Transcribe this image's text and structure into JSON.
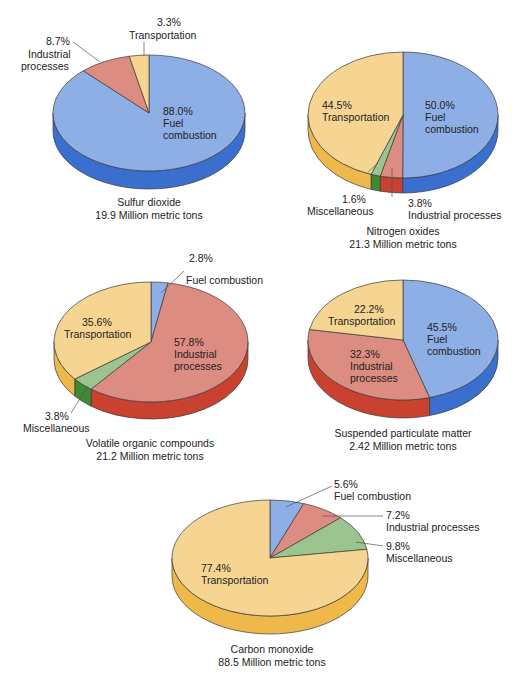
{
  "colors": {
    "fuel_combustion": {
      "top": "#8eaee6",
      "side": "#3b6fcf"
    },
    "industrial_processes": {
      "top": "#dc8c80",
      "side": "#c8422f"
    },
    "transportation": {
      "top": "#f6d592",
      "side": "#eeb94a"
    },
    "miscellaneous": {
      "top": "#9cc48e",
      "side": "#3f8a35"
    },
    "outline": "#3a3a3a"
  },
  "chart_data": [
    {
      "type": "pie",
      "title": "Sulfur dioxide",
      "subtitle": "19.9 Million metric tons",
      "categories": [
        "Fuel combustion",
        "Industrial processes",
        "Transportation"
      ],
      "values": [
        88.0,
        8.7,
        3.3
      ],
      "labels": [
        "88.0%",
        "8.7%",
        "3.3%"
      ]
    },
    {
      "type": "pie",
      "title": "Nitrogen oxides",
      "subtitle": "21.3 Million metric tons",
      "categories": [
        "Fuel combustion",
        "Industrial processes",
        "Miscellaneous",
        "Transportation"
      ],
      "values": [
        50.0,
        3.8,
        1.6,
        44.5
      ],
      "labels": [
        "50.0%",
        "3.8%",
        "1.6%",
        "44.5%"
      ]
    },
    {
      "type": "pie",
      "title": "Volatile organic compounds",
      "subtitle": "21.2 Million metric tons",
      "categories": [
        "Fuel combustion",
        "Industrial processes",
        "Miscellaneous",
        "Transportation"
      ],
      "values": [
        2.8,
        57.8,
        3.8,
        35.6
      ],
      "labels": [
        "2.8%",
        "57.8%",
        "3.8%",
        "35.6%"
      ]
    },
    {
      "type": "pie",
      "title": "Suspended particulate matter",
      "subtitle": "2.42 Million metric tons",
      "categories": [
        "Fuel combustion",
        "Industrial processes",
        "Transportation"
      ],
      "values": [
        45.5,
        32.3,
        22.2
      ],
      "labels": [
        "45.5%",
        "32.3%",
        "22.2%"
      ]
    },
    {
      "type": "pie",
      "title": "Carbon monoxide",
      "subtitle": "88.5 Million metric tons",
      "categories": [
        "Fuel combustion",
        "Industrial processes",
        "Miscellaneous",
        "Transportation"
      ],
      "values": [
        5.6,
        7.2,
        9.8,
        77.4
      ],
      "labels": [
        "5.6%",
        "7.2%",
        "9.8%",
        "77.4%"
      ]
    }
  ],
  "text": {
    "so2": {
      "fuel_pct": "88.0%",
      "fuel_l1": "Fuel",
      "fuel_l2": "combustion",
      "ind_pct": "8.7%",
      "ind_l1": "Industrial",
      "ind_l2": "processes",
      "trans_pct": "3.3%",
      "trans_l1": "Transportation",
      "cap1": "Sulfur dioxide",
      "cap2": "19.9 Million metric tons"
    },
    "nox": {
      "trans_pct": "44.5%",
      "trans_l1": "Transportation",
      "fuel_pct": "50.0%",
      "fuel_l1": "Fuel",
      "fuel_l2": "combustion",
      "misc_pct": "1.6%",
      "misc_l1": "Miscellaneous",
      "ind_pct": "3.8%",
      "ind_l1": "Industrial processes",
      "cap1": "Nitrogen oxides",
      "cap2": "21.3 Million metric tons"
    },
    "voc": {
      "fuel_pct": "2.8%",
      "fuel_l1": "Fuel combustion",
      "trans_pct": "35.6%",
      "trans_l1": "Transportation",
      "ind_pct": "57.8%",
      "ind_l1": "Industrial",
      "ind_l2": "processes",
      "misc_pct": "3.8%",
      "misc_l1": "Miscellaneous",
      "cap1": "Volatile organic compounds",
      "cap2": "21.2 Million metric tons"
    },
    "spm": {
      "trans_pct": "22.2%",
      "trans_l1": "Transportation",
      "fuel_pct": "45.5%",
      "fuel_l1": "Fuel",
      "fuel_l2": "combustion",
      "ind_pct": "32.3%",
      "ind_l1": "Industrial",
      "ind_l2": "processes",
      "cap1": "Suspended particulate matter",
      "cap2": "2.42 Million metric tons"
    },
    "co": {
      "fuel_pct": "5.6%",
      "fuel_l1": "Fuel combustion",
      "ind_pct": "7.2%",
      "ind_l1": "Industrial processes",
      "misc_pct": "9.8%",
      "misc_l1": "Miscellaneous",
      "trans_pct": "77.4%",
      "trans_l1": "Transportation",
      "cap1": "Carbon monoxide",
      "cap2": "88.5 Million metric tons"
    }
  }
}
